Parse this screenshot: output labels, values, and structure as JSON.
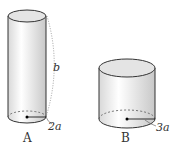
{
  "cylinders": [
    {
      "label": "A",
      "height_label": "b",
      "radius_label": "2a"
    },
    {
      "label": "B",
      "radius_label": "3a"
    }
  ]
}
